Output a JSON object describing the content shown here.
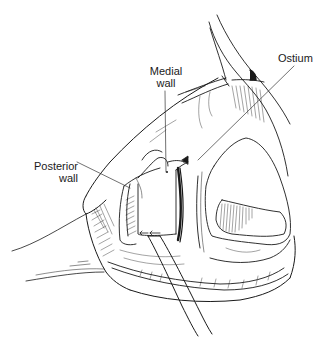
{
  "figure": {
    "colors": {
      "ink": "#1a1a1a",
      "background": "#ffffff"
    },
    "labels": {
      "medial_wall": {
        "line1": "Medial",
        "line2": "wall"
      },
      "ostium": {
        "line1": "Ostium"
      },
      "posterior_wall": {
        "line1": "Posterior",
        "line2": "wall"
      }
    }
  }
}
